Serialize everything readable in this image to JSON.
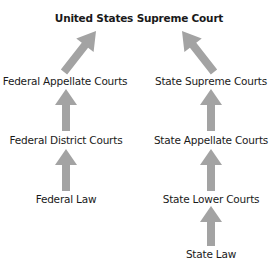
{
  "diagram": {
    "title": "United States Supreme Court",
    "arrow_color": "#a3a3a3",
    "federal": {
      "levels": [
        "Federal Appellate Courts",
        "Federal District Courts",
        "Federal Law"
      ]
    },
    "state": {
      "levels": [
        "State Supreme Courts",
        "State Appellate Courts",
        "State Lower Courts",
        "State Law"
      ]
    },
    "edges": [
      {
        "from": "Federal Law",
        "to": "Federal District Courts"
      },
      {
        "from": "Federal District Courts",
        "to": "Federal Appellate Courts"
      },
      {
        "from": "Federal Appellate Courts",
        "to": "United States Supreme Court"
      },
      {
        "from": "State Law",
        "to": "State Lower Courts"
      },
      {
        "from": "State Lower Courts",
        "to": "State Appellate Courts"
      },
      {
        "from": "State Appellate Courts",
        "to": "State Supreme Courts"
      },
      {
        "from": "State Supreme Courts",
        "to": "United States Supreme Court"
      }
    ]
  }
}
